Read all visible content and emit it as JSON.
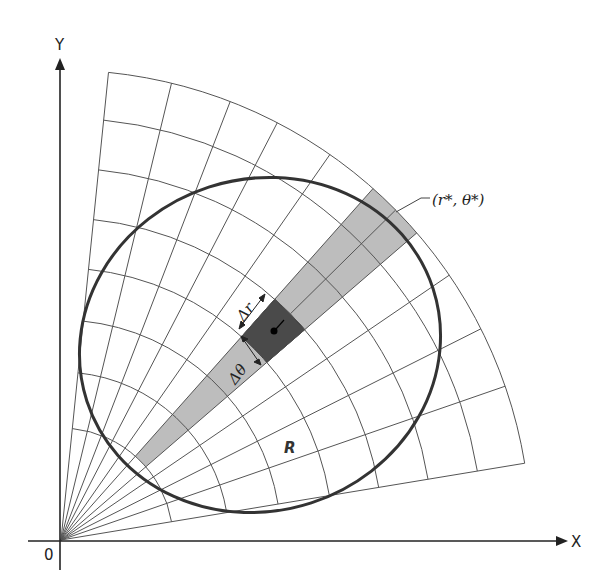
{
  "figure": {
    "axes": {
      "x_label": "X",
      "y_label": "Y",
      "origin_label": "0"
    },
    "region_label": "R",
    "sample_point_label": "(r*, θ*)",
    "delta_r_label": "Δr",
    "delta_theta_label": "Δθ",
    "colors": {
      "grid_line": "#555555",
      "boundary": "#333333",
      "band_fill": "#bdbdbd",
      "cell_fill": "#4a4a4a",
      "axis": "#222222"
    },
    "grid": {
      "origin_px": [
        61,
        540
      ],
      "ray_angles_deg": [
        84.2,
        76.4,
        68.9,
        62.6,
        55.1,
        48.4,
        40.8,
        34.3,
        26.7,
        19.1,
        9.4
      ],
      "arc_radii_px": [
        112,
        168,
        220,
        272,
        322,
        372,
        422,
        470
      ]
    }
  }
}
